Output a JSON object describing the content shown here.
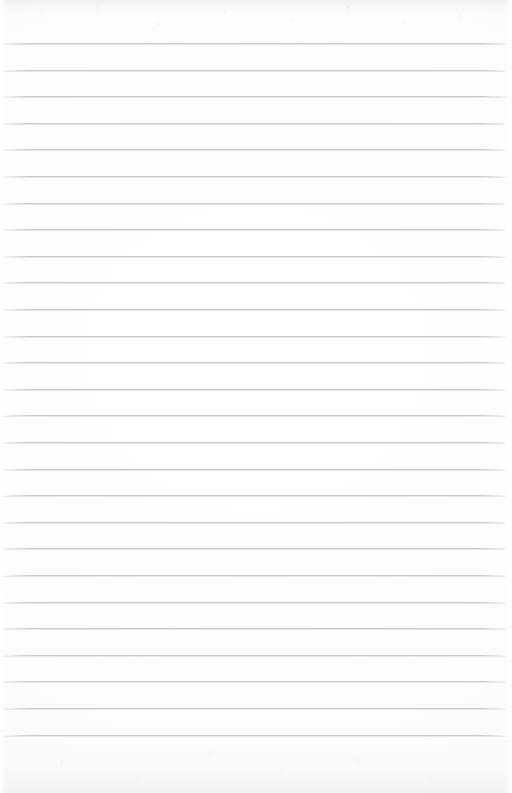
{
  "document": {
    "type": "ruled-paper",
    "title": "Blank lined paper page",
    "content_text": "",
    "page_width": 512,
    "page_height": 793
  },
  "paper": {
    "background_color": "#fdfdfd",
    "base_white": "#ffffff",
    "texture": "subtle mottled scan grain, strongest at top and bottom edges",
    "has_margin_rule": false,
    "has_holes": false,
    "has_handwriting": false
  },
  "ruling": {
    "line_color": "#c6c9cf",
    "line_highlight_color": "#e1e3e7",
    "line_thickness_px": 1,
    "line_spacing_px": 26.6,
    "first_line_y": 43,
    "last_line_y": 735,
    "line_start_x": 3,
    "line_end_x": 506,
    "line_count": 27,
    "lines": [
      {
        "index": 1,
        "y": 43.0
      },
      {
        "index": 2,
        "y": 69.6
      },
      {
        "index": 3,
        "y": 96.2
      },
      {
        "index": 4,
        "y": 122.8
      },
      {
        "index": 5,
        "y": 149.4
      },
      {
        "index": 6,
        "y": 176.0
      },
      {
        "index": 7,
        "y": 202.6
      },
      {
        "index": 8,
        "y": 229.2
      },
      {
        "index": 9,
        "y": 255.8
      },
      {
        "index": 10,
        "y": 282.4
      },
      {
        "index": 11,
        "y": 309.0
      },
      {
        "index": 12,
        "y": 335.6
      },
      {
        "index": 13,
        "y": 362.2
      },
      {
        "index": 14,
        "y": 388.8
      },
      {
        "index": 15,
        "y": 415.4
      },
      {
        "index": 16,
        "y": 442.0
      },
      {
        "index": 17,
        "y": 468.6
      },
      {
        "index": 18,
        "y": 495.2
      },
      {
        "index": 19,
        "y": 521.8
      },
      {
        "index": 20,
        "y": 548.4
      },
      {
        "index": 21,
        "y": 575.0
      },
      {
        "index": 22,
        "y": 601.6
      },
      {
        "index": 23,
        "y": 628.2
      },
      {
        "index": 24,
        "y": 654.8
      },
      {
        "index": 25,
        "y": 681.4
      },
      {
        "index": 26,
        "y": 708.0
      },
      {
        "index": 27,
        "y": 734.6
      }
    ]
  },
  "margins": {
    "top_px": 43,
    "bottom_px": 58,
    "left_px": 3,
    "right_px": 6
  }
}
